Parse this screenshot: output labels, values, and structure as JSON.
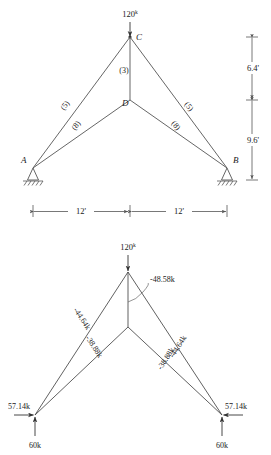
{
  "figure": {
    "panels": [
      {
        "id": "upper",
        "name": "truss-geometry-diagram",
        "applied_load": {
          "value": "120",
          "unit": "k",
          "text": "120k"
        },
        "nodes": [
          {
            "label": "C",
            "name": "node-c"
          },
          {
            "label": "D",
            "name": "node-d"
          },
          {
            "label": "A",
            "name": "node-a"
          },
          {
            "label": "B",
            "name": "node-b"
          }
        ],
        "member_labels": [
          {
            "text": "(3)",
            "name": "member-label-3"
          },
          {
            "text": "(5)",
            "name": "member-label-5-left"
          },
          {
            "text": "(8)",
            "name": "member-label-8-left"
          },
          {
            "text": "(5)",
            "name": "member-label-5-right"
          },
          {
            "text": "(8)",
            "name": "member-label-8-right"
          }
        ],
        "vertical_dimensions": [
          {
            "text": "6.4'",
            "name": "dimension-6-4"
          },
          {
            "text": "9.6'",
            "name": "dimension-9-6"
          }
        ],
        "horizontal_dimensions": [
          {
            "text": "12'",
            "name": "dimension-12-left"
          },
          {
            "text": "12'",
            "name": "dimension-12-right"
          }
        ]
      },
      {
        "id": "lower",
        "name": "free-body-force-diagram",
        "applied_load": {
          "value": "120",
          "unit": "k",
          "text": "120k"
        },
        "member_forces": [
          {
            "text": "-48.58k",
            "name": "force-label-vertical"
          },
          {
            "text": "-44.64k",
            "name": "force-label-upper-left"
          },
          {
            "text": "-38.88k",
            "name": "force-label-lower-left"
          },
          {
            "text": "-44.64k",
            "name": "force-label-upper-right"
          },
          {
            "text": "-38.88k",
            "name": "force-label-lower-right"
          }
        ],
        "reactions": [
          {
            "text": "57.14k",
            "name": "reaction-horizontal-left"
          },
          {
            "text": "60k",
            "name": "reaction-vertical-left"
          },
          {
            "text": "57.14k",
            "name": "reaction-horizontal-right"
          },
          {
            "text": "60k",
            "name": "reaction-vertical-right"
          }
        ]
      }
    ]
  },
  "colors": {
    "member": "#555555",
    "text": "#1a1a1a",
    "arrow": "#333333",
    "background": "#ffffff"
  }
}
